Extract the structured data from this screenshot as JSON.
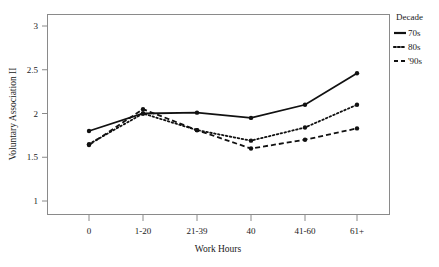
{
  "chart_data": {
    "type": "line",
    "title": "",
    "xlabel": "Work Hours",
    "ylabel": "Voluntary Association II",
    "categories": [
      "0",
      "1-20",
      "21-39",
      "40",
      "41-60",
      "61+"
    ],
    "ylim": [
      1,
      3
    ],
    "yticks": [
      "1",
      "1.5",
      "2",
      "2.5",
      "3"
    ],
    "ytick_values": [
      1,
      1.5,
      2,
      2.5,
      3
    ],
    "grid": false,
    "legend_position": "right",
    "legend_title": "Decade",
    "series": [
      {
        "name": "70s",
        "style": "solid",
        "color": "#111111",
        "values": [
          1.8,
          2.0,
          2.01,
          1.95,
          2.1,
          2.46
        ]
      },
      {
        "name": "80s",
        "style": "dotted",
        "color": "#111111",
        "values": [
          1.65,
          2.0,
          1.81,
          1.69,
          1.84,
          2.1
        ]
      },
      {
        "name": "'90s",
        "style": "dashed",
        "color": "#111111",
        "values": [
          1.64,
          2.05,
          1.81,
          1.6,
          1.7,
          1.83
        ]
      }
    ]
  },
  "axes": {
    "y_title": "Voluntary Association II",
    "x_title": "Work Hours",
    "y_tick_labels": [
      "3",
      "2.5",
      "2",
      "1.5",
      "1"
    ],
    "x_tick_labels": [
      "0",
      "1-20",
      "21-39",
      "40",
      "41-60",
      "61+"
    ]
  },
  "legend": {
    "title": "Decade",
    "items": [
      {
        "label": "70s",
        "style": "solid"
      },
      {
        "label": "80s",
        "style": "dotted"
      },
      {
        "label": "'90s",
        "style": "dashed"
      }
    ]
  },
  "colors": {
    "line": "#111111",
    "frame": "#8a8a8a",
    "background": "#ffffff",
    "text": "#1a1a1a"
  }
}
